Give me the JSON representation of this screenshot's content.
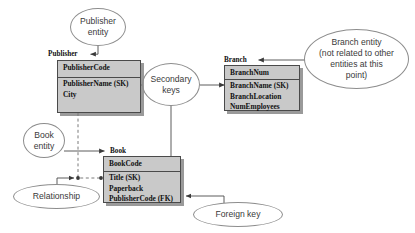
{
  "diagram": {
    "colors": {
      "table_fill": "#c9c9c9",
      "table_border": "#4a4a4a",
      "shadow": "#787878",
      "callout_border": "#8d8d8d",
      "wire": "#4a4a4a",
      "text": "#111111",
      "callout_text": "#3a3a3a"
    },
    "entities": [
      {
        "id": "publisher",
        "name": "Publisher",
        "key_field": "PublisherCode",
        "fields": [
          "PublisherName (SK)",
          "City"
        ]
      },
      {
        "id": "branch",
        "name": "Branch",
        "key_field": "BranchNum",
        "fields": [
          "BranchName (SK)",
          "BranchLocation",
          "NumEmployees"
        ]
      },
      {
        "id": "book",
        "name": "Book",
        "key_field": "BookCode",
        "fields": [
          "Title (SK)",
          "Paperback",
          "PublisherCode (FK)"
        ]
      }
    ],
    "callouts": [
      {
        "id": "publisher-entity",
        "lines": [
          "Publisher",
          "entity"
        ]
      },
      {
        "id": "secondary-keys",
        "lines": [
          "Secondary",
          "keys"
        ]
      },
      {
        "id": "branch-entity",
        "lines": [
          "Branch entity",
          "(not related to other",
          "entities at this",
          "point)"
        ]
      },
      {
        "id": "book-entity",
        "lines": [
          "Book",
          "entity"
        ]
      },
      {
        "id": "relationship",
        "lines": [
          "Relationship"
        ]
      },
      {
        "id": "foreign-key",
        "lines": [
          "Foreign key"
        ]
      }
    ]
  }
}
